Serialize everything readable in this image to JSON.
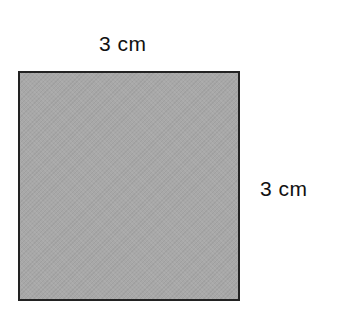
{
  "diagram": {
    "shape": "square",
    "fill_color": "#a8a8a8",
    "border_color": "#222222",
    "labels": {
      "top": "3 cm",
      "right": "3 cm"
    },
    "side_length": 3,
    "unit": "cm"
  }
}
